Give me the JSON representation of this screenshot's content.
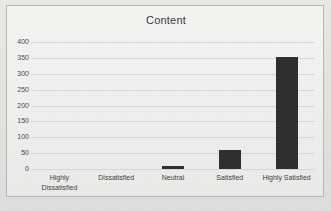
{
  "chart": {
    "title": "Content",
    "frame_border_color": "#b6b6b4",
    "bar_color": "#2e2e2e",
    "gridline_color": "#d6d6d6"
  },
  "chart_data": {
    "type": "bar",
    "title": "Content",
    "xlabel": "",
    "ylabel": "",
    "categories": [
      "Highly Dissatisfied",
      "Dissatisfied",
      "Neutral",
      "Satisfied",
      "Highly Satisfied"
    ],
    "category_lines": [
      [
        "Highly",
        "Dissatisfied"
      ],
      [
        "Dissatisfied"
      ],
      [
        "Neutral"
      ],
      [
        "Satisfied"
      ],
      [
        "Highly Satisfied"
      ]
    ],
    "values": [
      0,
      0,
      10,
      60,
      352
    ],
    "ylim": [
      0,
      400
    ],
    "ytick_values": [
      400,
      350,
      300,
      250,
      200,
      150,
      100,
      50,
      0
    ],
    "ytick_labels": [
      "400",
      "350",
      "300",
      "250",
      "200",
      "150",
      "100",
      "50",
      "0"
    ],
    "grid": true,
    "grid_axis": "y",
    "legend": false,
    "legend_position": "none"
  }
}
